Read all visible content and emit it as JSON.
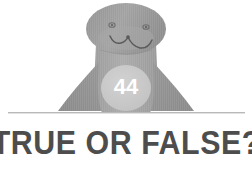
{
  "canvas": {
    "width": 252,
    "height": 169,
    "background_color": "#ffffff"
  },
  "mascot": {
    "name": "seal-mascot",
    "description": "grayscale cartoon seal with rounded head, two eyes, W-shaped smile and spread flippers",
    "colors": {
      "head": "#9a9a9a",
      "head_shadow": "#8d8d8d",
      "body": "#a5a5a5",
      "flipper": "#8f8f8f",
      "belly_badge": "#c8c8c8",
      "facial_line": "#5d5d5d",
      "eye": "#6b6b6b"
    }
  },
  "badge": {
    "label": "44",
    "text_color": "#ffffff",
    "fill_color": "#c8c8c8"
  },
  "divider": {
    "color": "#b9b9b9",
    "shadow_color": "#e2e2e2"
  },
  "headline": {
    "text": "TRUE OR FALSE?",
    "color": "#4d4d4d"
  }
}
